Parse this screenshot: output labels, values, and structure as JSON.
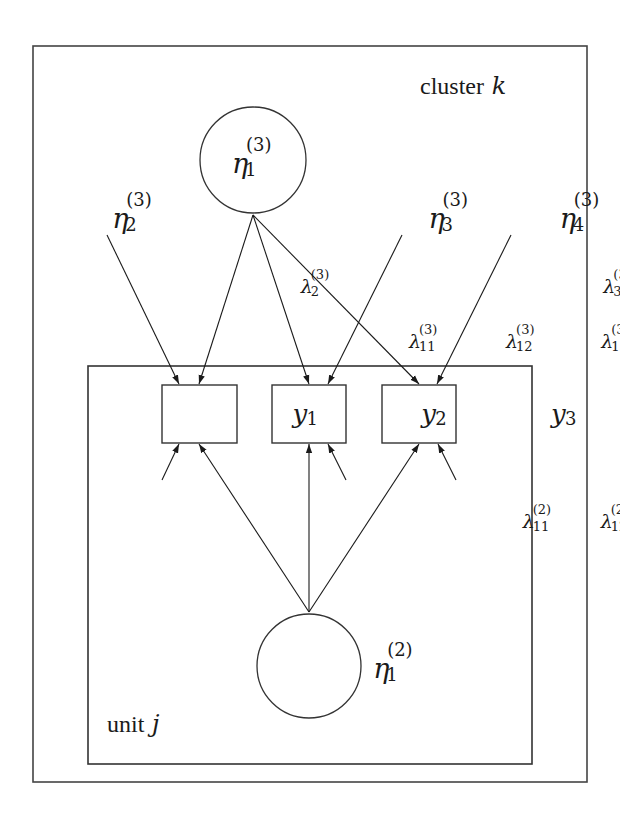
{
  "diagram": {
    "type": "multilevel structural equation model (path diagram)",
    "plates": {
      "outer": {
        "label_text": "cluster",
        "label_index": "k"
      },
      "inner": {
        "label_text": "unit",
        "label_index": "j"
      }
    },
    "latent_variables": [
      {
        "id": "eta1_3",
        "base": "η",
        "sub": "1",
        "sup": "(3)",
        "shape": "circle"
      },
      {
        "id": "eta2_3",
        "base": "η",
        "sub": "2",
        "sup": "(3)",
        "shape": "none"
      },
      {
        "id": "eta3_3",
        "base": "η",
        "sub": "3",
        "sup": "(3)",
        "shape": "none"
      },
      {
        "id": "eta4_3",
        "base": "η",
        "sub": "4",
        "sup": "(3)",
        "shape": "none"
      },
      {
        "id": "eta1_2",
        "base": "η",
        "sub": "1",
        "sup": "(2)",
        "shape": "circle"
      }
    ],
    "observed_variables": [
      {
        "id": "y1",
        "base": "y",
        "sub": "1"
      },
      {
        "id": "y2",
        "base": "y",
        "sub": "2"
      },
      {
        "id": "y3",
        "base": "y",
        "sub": "3"
      }
    ],
    "loadings": [
      {
        "base": "λ",
        "sub": "2",
        "sup": "(3)",
        "from": "eta2_3",
        "to": "y1"
      },
      {
        "base": "λ",
        "sub": "11",
        "sup": "(3)",
        "from": "eta1_3",
        "to": "y1"
      },
      {
        "base": "λ",
        "sub": "12",
        "sup": "(3)",
        "from": "eta1_3",
        "to": "y2"
      },
      {
        "base": "λ",
        "sub": "13",
        "sup": "(3)",
        "from": "eta1_3",
        "to": "y3"
      },
      {
        "base": "λ",
        "sub": "3",
        "sup": "(3)",
        "from": "eta3_3",
        "to": "y2"
      },
      {
        "base": "λ",
        "sub": "4",
        "sup": "(3)",
        "from": "eta4_3",
        "to": "y3"
      },
      {
        "base": "λ",
        "sub": "11",
        "sup": "(2)",
        "from": "eta1_2",
        "to": "y1"
      },
      {
        "base": "λ",
        "sub": "12",
        "sup": "(2)",
        "from": "eta1_2",
        "to": "y2"
      },
      {
        "base": "λ",
        "sub": "13",
        "sup": "(2)",
        "from": "eta1_2",
        "to": "y3"
      }
    ],
    "error_terms": [
      "y1",
      "y2",
      "y3"
    ],
    "colors": {
      "line": "#1a1a1a",
      "background": "#ffffff"
    }
  }
}
